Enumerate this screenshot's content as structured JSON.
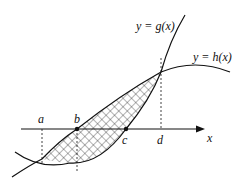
{
  "diagram": {
    "curves": [
      {
        "id": "g",
        "label": "y = g(x)"
      },
      {
        "id": "h",
        "label": "y = h(x)"
      }
    ],
    "axis": {
      "label": "x"
    },
    "points": [
      {
        "id": "a",
        "label": "a"
      },
      {
        "id": "b",
        "label": "b"
      },
      {
        "id": "c",
        "label": "c"
      },
      {
        "id": "d",
        "label": "d"
      }
    ],
    "shaded_region": "region between y = g(x) and y = h(x) from a to d (cross-hatched)",
    "colors": {
      "stroke": "#111111",
      "background": "#ffffff"
    }
  }
}
